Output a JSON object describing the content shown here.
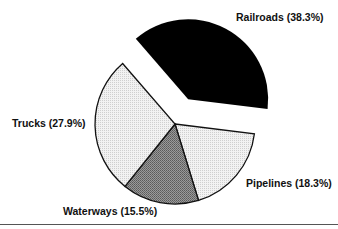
{
  "chart_data": {
    "type": "pie",
    "title": "",
    "exploded": "Railroads",
    "slices": [
      {
        "label": "Railroads",
        "value": 38.3,
        "display": "Railroads (38.3%)",
        "fill": "#000000",
        "pattern": "solid"
      },
      {
        "label": "Pipelines",
        "value": 18.3,
        "display": "Pipelines (18.3%)",
        "fill": "#e6e6e6",
        "pattern": "light-dots"
      },
      {
        "label": "Waterways",
        "value": 15.5,
        "display": "Waterways (15.5%)",
        "fill": "#8a8a8a",
        "pattern": "dark-dots"
      },
      {
        "label": "Trucks",
        "value": 27.9,
        "display": "Trucks (27.9%)",
        "fill": "#ececec",
        "pattern": "light-dots"
      }
    ]
  }
}
